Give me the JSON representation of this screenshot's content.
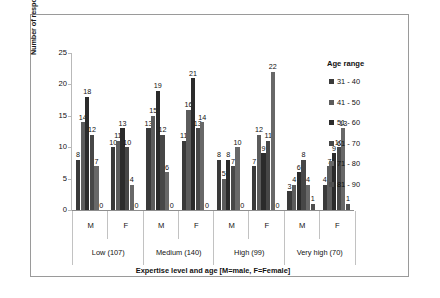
{
  "chart_data": {
    "type": "bar",
    "title": "",
    "xlabel": "Expertise level and age [M=male, F=Female]",
    "ylabel": "Number of respondents",
    "ylim": [
      0,
      25
    ],
    "yticks": [
      0,
      5,
      10,
      15,
      20,
      25
    ],
    "grid": false,
    "legend_position": "right",
    "legend_title": "Age range",
    "categories": [
      "M",
      "F",
      "M",
      "F",
      "M",
      "F",
      "M",
      "F"
    ],
    "group_labels": [
      "Low (107)",
      "Medium (140)",
      "High (99)",
      "Very high (70)"
    ],
    "series": [
      {
        "name": "31 - 40",
        "color": "#3a3a3a",
        "values": [
          8,
          10,
          13,
          11,
          8,
          7,
          3,
          4
        ]
      },
      {
        "name": "41 - 50",
        "color": "#5c5c5c",
        "values": [
          14,
          11,
          15,
          16,
          5,
          12,
          4,
          7
        ]
      },
      {
        "name": "51 - 60",
        "color": "#2b2b2b",
        "values": [
          18,
          13,
          19,
          21,
          8,
          9,
          6,
          9
        ]
      },
      {
        "name": "61 - 70",
        "color": "#474747",
        "values": [
          12,
          10,
          12,
          13,
          7,
          11,
          8,
          10
        ]
      },
      {
        "name": "71 - 80",
        "color": "#686868",
        "values": [
          7,
          4,
          6,
          14,
          10,
          22,
          4,
          13
        ]
      },
      {
        "name": "81 - 90",
        "color": "#4f4f4f",
        "values": [
          0,
          0,
          0,
          0,
          0,
          0,
          1,
          1
        ]
      }
    ]
  }
}
